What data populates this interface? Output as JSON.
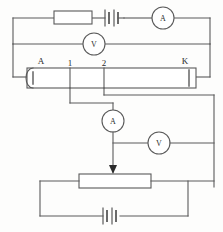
{
  "diagram": {
    "stroke_color": "#5a5a5a",
    "text_color": "#2b2b2b",
    "background": "#fdfdfc",
    "labels": {
      "wire_left_terminal": "A",
      "wire_right_terminal": "K",
      "tap_one": "1",
      "tap_two": "2"
    },
    "meters": {
      "driver_ammeter": "A",
      "driver_voltmeter": "V",
      "measure_ammeter": "A",
      "measure_voltmeter": "V"
    },
    "components": {
      "rheostat": "rheostat-box",
      "driver_battery": "battery-two-cell",
      "lower_rheostat": "resistor-box-with-slider",
      "lower_battery": "battery-two-cell",
      "potentiometer_wire": "potentiometer-wire"
    }
  }
}
